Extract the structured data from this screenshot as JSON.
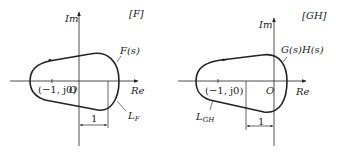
{
  "panels": [
    {
      "tag": "[F]",
      "im_label": "Im",
      "re_label": "Re",
      "curve_label": "F(s)",
      "contour_label_main": "L",
      "contour_label_sub": "F",
      "point_label": "(−1, j0)",
      "origin_label": "O",
      "unit_label": "1"
    },
    {
      "tag": "[GH]",
      "im_label": "Im",
      "re_label": "Re",
      "curve_label": "G(s)H(s)",
      "contour_label_main": "L",
      "contour_label_sub": "GH",
      "point_label": "(−1, j0)",
      "origin_label": "O",
      "unit_label": "1"
    }
  ],
  "colors": {
    "stroke": "#222222",
    "background": "#ffffff"
  }
}
